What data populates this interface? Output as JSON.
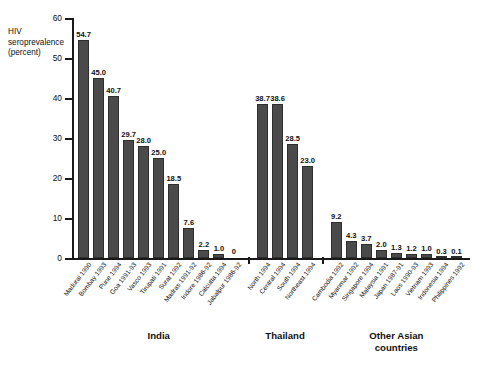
{
  "chart_data": {
    "type": "bar",
    "title": "",
    "subtitle": "",
    "xlabel": "",
    "ylabel": "HIV\nseroprevalence\n(percent)",
    "ylim": [
      0,
      60
    ],
    "yticks": [
      0,
      10,
      20,
      30,
      40,
      50,
      60
    ],
    "grid": false,
    "legend": null,
    "orientation": "vertical",
    "bar_color": "#4a4a4a",
    "categories": [
      "Madurai 1990",
      "Bombay 1993",
      "Pune 1994",
      "Goa 1991-93",
      "Vasco 1993",
      "Tirupati 1991",
      "Surat 1992",
      "Madras 1991-92",
      "Indore 1986-92",
      "Calcutta 1994",
      "Jabalpur 1986-92",
      "North 1994",
      "Central 1994",
      "South 1994",
      "Northeast 1994",
      "Cambodia 1992",
      "Myanmar 1992",
      "Singapore 1994",
      "Malaysia 1991",
      "Japan 1987-91",
      "Laos 1990-93",
      "Vietnam 1993",
      "Indonesia 1994",
      "Philippines 1992"
    ],
    "values": [
      54.7,
      45.0,
      40.7,
      29.7,
      28.0,
      25.0,
      18.5,
      7.6,
      2.2,
      1.0,
      0,
      38.7,
      38.6,
      28.5,
      23.0,
      9.2,
      4.3,
      3.7,
      2.0,
      1.3,
      1.2,
      1.0,
      0.3,
      0.1
    ],
    "value_labels": [
      "54.7",
      "45.0",
      "40.7",
      "29.7",
      "28.0",
      "25.0",
      "18.5",
      "7.6",
      "2.2",
      "1.0",
      "0",
      "38.7",
      "38.6",
      "28.5",
      "23.0",
      "9.2",
      "4.3",
      "3.7",
      "2.0",
      "1.3",
      "1.2",
      "1.0",
      "0.3",
      "0.1"
    ],
    "groups": [
      {
        "label": "India",
        "start": 0,
        "end": 10
      },
      {
        "label": "Thailand",
        "start": 11,
        "end": 14
      },
      {
        "label": "Other Asian\ncountries",
        "start": 15,
        "end": 23
      }
    ]
  }
}
